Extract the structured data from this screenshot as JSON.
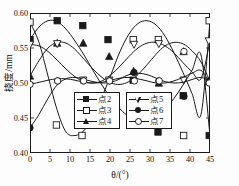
{
  "chart_data": {
    "type": "line",
    "title": "",
    "xlabel": "θ/(°)",
    "ylabel": "挠度/mm",
    "xlim": [
      0,
      45
    ],
    "ylim": [
      0.4,
      0.6
    ],
    "xticks": [
      0,
      5,
      10,
      15,
      20,
      25,
      30,
      35,
      40,
      45
    ],
    "xticklabels": [
      "0",
      "5",
      "10",
      "15",
      "20",
      "25",
      "30",
      "35",
      "40",
      "45"
    ],
    "yticks": [
      0.4,
      0.45,
      0.5,
      0.55,
      0.6
    ],
    "yticklabels": [
      "0.40",
      "0.45",
      "0.50",
      "0.55",
      "0.60"
    ],
    "grid": false,
    "legend_position": "lower-center",
    "period_deg": 22.5,
    "x": [
      0,
      2.25,
      4.5,
      6.75,
      9,
      11.25,
      13.5,
      15.75,
      18,
      20.25,
      22.5,
      24.75,
      27,
      29.25,
      31.5,
      33.75,
      36,
      38.25,
      40.5,
      42.75,
      45
    ],
    "series": [
      {
        "name": "点2",
        "marker": "filled-square",
        "marker_x": [
          0,
          6.8,
          13.2,
          19.5,
          25.8,
          32,
          38.3,
          44.8
        ],
        "marker_y": [
          0.562,
          0.589,
          0.582,
          0.562,
          0.504,
          0.43,
          0.482,
          0.425
        ],
        "values": [
          0.562,
          0.58,
          0.589,
          0.588,
          0.577,
          0.56,
          0.54,
          0.518,
          0.497,
          0.478,
          0.463,
          0.452,
          0.447,
          0.447,
          0.452,
          0.463,
          0.478,
          0.497,
          0.518,
          0.54,
          0.425
        ]
      },
      {
        "name": "点3",
        "marker": "open-square",
        "marker_x": [
          0,
          6.6,
          13.0,
          19.8,
          25.8,
          32.1,
          38.4,
          44.8
        ],
        "marker_y": [
          0.587,
          0.44,
          0.425,
          0.44,
          0.562,
          0.562,
          0.425,
          0.589
        ],
        "values": [
          0.587,
          0.558,
          0.51,
          0.462,
          0.43,
          0.425,
          0.432,
          0.452,
          0.48,
          0.512,
          0.545,
          0.57,
          0.585,
          0.589,
          0.583,
          0.567,
          0.543,
          0.515,
          0.485,
          0.455,
          0.589
        ]
      },
      {
        "name": "点4",
        "marker": "filled-triangle",
        "marker_x": [
          0,
          6.8,
          13.3,
          19.8,
          25.9,
          32.2,
          38.4,
          44.6
        ],
        "marker_y": [
          0.51,
          0.557,
          0.557,
          0.538,
          0.517,
          0.5,
          0.545,
          0.502
        ],
        "values": [
          0.51,
          0.532,
          0.55,
          0.558,
          0.557,
          0.548,
          0.534,
          0.52,
          0.508,
          0.5,
          0.498,
          0.502,
          0.512,
          0.526,
          0.541,
          0.553,
          0.558,
          0.556,
          0.546,
          0.53,
          0.502
        ]
      },
      {
        "name": "点5",
        "marker": "open-down-triangle",
        "marker_x": [
          0,
          6.8,
          13.3,
          19.8,
          26.0,
          32.2,
          38.4,
          44.7
        ],
        "marker_y": [
          0.555,
          0.556,
          0.504,
          0.504,
          0.555,
          0.556,
          0.504,
          0.56
        ],
        "values": [
          0.555,
          0.553,
          0.545,
          0.533,
          0.52,
          0.509,
          0.502,
          0.5,
          0.503,
          0.512,
          0.524,
          0.538,
          0.55,
          0.557,
          0.558,
          0.553,
          0.543,
          0.529,
          0.516,
          0.506,
          0.56
        ]
      },
      {
        "name": "点6",
        "marker": "filled-circle",
        "marker_x": [
          0,
          6.9,
          13.3,
          19.9,
          26.0,
          32.2,
          38.5,
          44.8
        ],
        "marker_y": [
          0.436,
          0.503,
          0.503,
          0.503,
          0.515,
          0.503,
          0.481,
          0.503
        ],
        "values": [
          0.436,
          0.455,
          0.478,
          0.497,
          0.506,
          0.508,
          0.505,
          0.502,
          0.5,
          0.501,
          0.506,
          0.512,
          0.514,
          0.512,
          0.507,
          0.502,
          0.5,
          0.501,
          0.505,
          0.508,
          0.503
        ]
      },
      {
        "name": "点7",
        "marker": "open-circle",
        "marker_x": [
          0,
          6.9,
          13.4,
          19.9,
          26.1,
          32.3,
          38.5,
          44.8
        ],
        "marker_y": [
          0.498,
          0.503,
          0.503,
          0.503,
          0.503,
          0.503,
          0.545,
          0.5
        ],
        "values": [
          0.498,
          0.501,
          0.504,
          0.506,
          0.506,
          0.504,
          0.501,
          0.5,
          0.501,
          0.504,
          0.507,
          0.508,
          0.506,
          0.503,
          0.5,
          0.5,
          0.503,
          0.508,
          0.514,
          0.518,
          0.5
        ]
      }
    ]
  },
  "legend_box_1": {
    "entries": [
      {
        "label": "点2",
        "marker": "filled-square"
      },
      {
        "label": "点3",
        "marker": "open-square"
      },
      {
        "label": "点4",
        "marker": "filled-triangle"
      }
    ]
  },
  "legend_box_2": {
    "entries": [
      {
        "label": "点5",
        "marker": "open-down-triangle"
      },
      {
        "label": "点6",
        "marker": "filled-circle"
      },
      {
        "label": "点7",
        "marker": "open-circle"
      }
    ]
  },
  "colors": {
    "line": "#1a1a1a",
    "axis": "#1a1a1a",
    "background": "#fdfdfd"
  }
}
